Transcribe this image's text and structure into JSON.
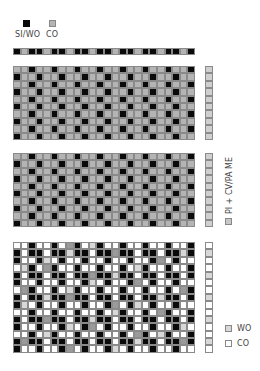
{
  "colors": {
    "black": "#0a0a0a",
    "grey": "#b4b4b4",
    "light_grey": "#d8d8d8",
    "white": "#ffffff",
    "accent_grey": "#9a9a9a"
  },
  "top_legend": [
    {
      "label": "SI/WO",
      "color": "black"
    },
    {
      "label": "CO",
      "color": "grey"
    }
  ],
  "side_label": {
    "text": "PI + CV/PA ME",
    "color": "grey"
  },
  "bottom_legend": [
    {
      "label": "WO",
      "color": "light_grey"
    },
    {
      "label": "CO",
      "color": "white"
    }
  ],
  "blocks": [
    {
      "name": "top-bar",
      "rows": 1,
      "cols": 24,
      "pattern": "bar"
    },
    {
      "name": "block-1",
      "rows": 10,
      "cols": 24,
      "pattern": "checker",
      "strip": "grey"
    },
    {
      "name": "block-2",
      "rows": 10,
      "cols": 24,
      "pattern": "checker",
      "strip": "grey"
    },
    {
      "name": "block-3",
      "rows": 15,
      "cols": 24,
      "pattern": "step",
      "strip": "white"
    }
  ]
}
